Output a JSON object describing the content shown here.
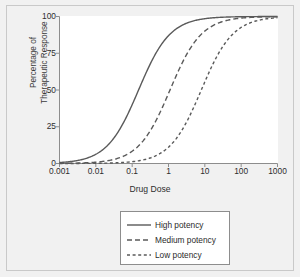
{
  "chart_data": {
    "type": "line",
    "title": "",
    "xlabel": "Drug Dose",
    "ylabel": "Percentage of Therapeutic Response",
    "ylabel_line1": "Percentage of",
    "ylabel_line2": "Therapeutic Response",
    "xscale": "log",
    "xlim": [
      0.001,
      1000
    ],
    "ylim": [
      0,
      100
    ],
    "grid": false,
    "legend_position": "below-plot",
    "xticks": [
      "0.001",
      "0.01",
      "0.1",
      "1",
      "10",
      "100",
      "1000"
    ],
    "xtick_values": [
      0.001,
      0.01,
      0.1,
      1,
      10,
      100,
      1000
    ],
    "yticks": [
      "0",
      "25",
      "50",
      "75",
      "100"
    ],
    "ytick_values": [
      0,
      25,
      50,
      75,
      100
    ],
    "x": [
      0.001,
      0.003,
      0.01,
      0.03,
      0.1,
      0.3,
      1,
      3,
      10,
      30,
      100,
      300,
      1000
    ],
    "series": [
      {
        "name": "High potency",
        "dash": "solid",
        "ec50": 0.15,
        "hill": 1.0,
        "color": "#5a5a5a",
        "values": [
          0.7,
          2.0,
          6.3,
          16.7,
          40.0,
          66.7,
          87.0,
          95.2,
          98.5,
          99.5,
          99.9,
          100,
          100
        ]
      },
      {
        "name": "Medium potency",
        "dash": "long-dash",
        "ec50": 1.1,
        "hill": 1.0,
        "color": "#5a5a5a",
        "values": [
          0.1,
          0.3,
          0.9,
          2.7,
          8.3,
          21.4,
          47.6,
          73.2,
          90.1,
          96.5,
          98.9,
          99.6,
          99.9
        ]
      },
      {
        "name": "Low potency",
        "dash": "short-dash",
        "ec50": 8.0,
        "hill": 1.0,
        "color": "#5a5a5a",
        "values": [
          0.01,
          0.04,
          0.1,
          0.4,
          1.2,
          3.6,
          11.1,
          27.3,
          55.6,
          78.9,
          92.6,
          97.4,
          99.2
        ]
      }
    ],
    "legend": [
      {
        "label": "High potency",
        "dash": "solid"
      },
      {
        "label": "Medium potency",
        "dash": "long-dash"
      },
      {
        "label": "Low potency",
        "dash": "short-dash"
      }
    ],
    "colors": {
      "curve": "#5a5a5a",
      "axis": "#8d8d8d",
      "text": "#2e2e2e",
      "background": "#f1f1f1",
      "plot_background": "#ffffff",
      "frame": "#c9c9c9"
    }
  }
}
